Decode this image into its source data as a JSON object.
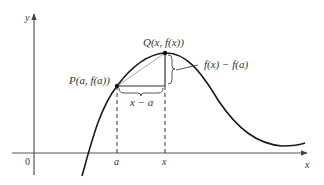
{
  "diagram": {
    "axes": {
      "y_label": "y",
      "x_label": "x",
      "origin_label": "0"
    },
    "points": {
      "P": {
        "label": "P(a, f(a))"
      },
      "Q": {
        "label": "Q(x, f(x))"
      }
    },
    "tick_labels": {
      "a": "a",
      "x": "x"
    },
    "annotations": {
      "horizontal_diff": "x − a",
      "vertical_diff": "f(x) − f(a)"
    },
    "colors": {
      "curve": "#1a1a1a",
      "axes": "#555555",
      "secant": "#aaaaaa",
      "dashed": "#333333"
    }
  }
}
